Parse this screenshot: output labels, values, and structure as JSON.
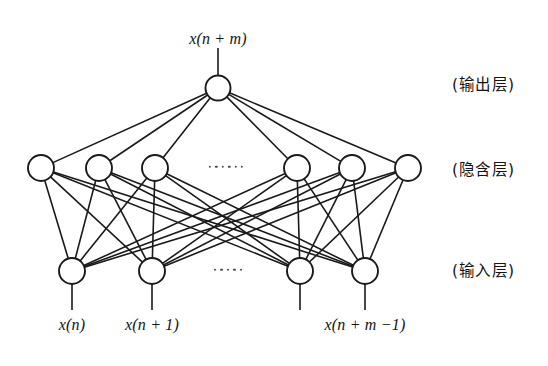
{
  "figure": {
    "title_label": "x(n + m)",
    "background_color": "#ffffff",
    "stroke_color": "#1a1a1a",
    "node_fill": "#ffffff"
  },
  "layers": {
    "output": {
      "chinese_label": "(输出层)",
      "node_count": 1,
      "node_radius": 12.5,
      "center_y": 88,
      "nodes": [
        {
          "cx": 218,
          "cy": 88
        }
      ],
      "stem": {
        "x": 218,
        "y_top": 48,
        "y_bottom": 75.5
      }
    },
    "hidden": {
      "chinese_label": "(隐含层)",
      "node_count": 6,
      "node_radius": 13,
      "center_y": 168,
      "nodes": [
        {
          "cx": 41,
          "cy": 168
        },
        {
          "cx": 99,
          "cy": 168
        },
        {
          "cx": 155,
          "cy": 168
        },
        {
          "cx": 297,
          "cy": 168
        },
        {
          "cx": 352,
          "cy": 168
        },
        {
          "cx": 408,
          "cy": 168
        }
      ],
      "ellipsis": {
        "x": 226,
        "y": 167,
        "dot_count": 6
      }
    },
    "input": {
      "chinese_label": "(输入层)",
      "node_count": 4,
      "node_radius": 13,
      "center_y": 271,
      "nodes": [
        {
          "cx": 72,
          "cy": 271
        },
        {
          "cx": 152,
          "cy": 271
        },
        {
          "cx": 300,
          "cy": 271
        },
        {
          "cx": 365,
          "cy": 271
        }
      ],
      "ellipsis": {
        "x": 228,
        "y": 270,
        "dot_count": 5
      },
      "stem_bottom_y": 310
    }
  },
  "connections": {
    "output_to_hidden": "full",
    "hidden_to_input": "full"
  },
  "input_labels": [
    {
      "text": "x(n)",
      "x": 72,
      "y": 316
    },
    {
      "text": "x(n + 1)",
      "x": 152,
      "y": 316
    },
    {
      "text": "x(n + m −1)",
      "x": 365,
      "y": 316
    }
  ],
  "layer_label_positions": [
    {
      "key": "output",
      "x": 452,
      "y": 72
    },
    {
      "key": "hidden",
      "x": 452,
      "y": 157
    },
    {
      "key": "input",
      "x": 452,
      "y": 258
    }
  ]
}
